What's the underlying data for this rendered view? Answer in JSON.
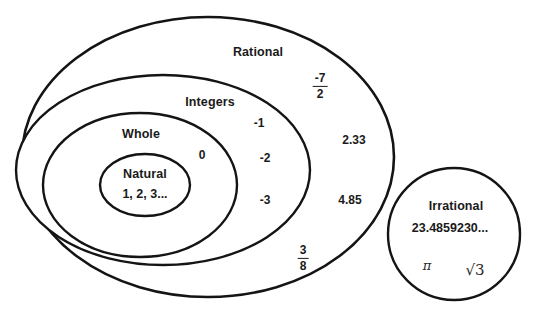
{
  "diagram": {
    "background_color": "#ffffff",
    "stroke_color": "#141414",
    "sets": [
      {
        "id": "rational",
        "label": "Rational",
        "shape": "ellipse",
        "cx": 208,
        "cy": 157,
        "rx": 186,
        "ry": 140,
        "stroke_width": 2.6,
        "label_x": 258,
        "label_y": 52
      },
      {
        "id": "integers",
        "label": "Integers",
        "shape": "ellipse",
        "cx": 163,
        "cy": 170,
        "rx": 147,
        "ry": 95,
        "stroke_width": 2.4,
        "label_x": 210,
        "label_y": 102
      },
      {
        "id": "whole",
        "label": "Whole",
        "shape": "ellipse",
        "cx": 140,
        "cy": 185,
        "rx": 97,
        "ry": 72,
        "stroke_width": 2.4,
        "label_x": 141,
        "label_y": 134
      },
      {
        "id": "natural",
        "label": "Natural",
        "shape": "ellipse",
        "cx": 145,
        "cy": 185,
        "rx": 45,
        "ry": 31,
        "stroke_width": 2.4,
        "label_x": 145,
        "label_y": 174
      },
      {
        "id": "irrational",
        "label": "Irrational",
        "shape": "circle",
        "cx": 454,
        "cy": 234,
        "r": 66,
        "stroke_width": 2.4,
        "label_x": 456,
        "label_y": 206
      }
    ],
    "elements": [
      {
        "id": "natural-examples",
        "text": "1, 2, 3...",
        "x": 145,
        "y": 194,
        "style": "elem-lg"
      },
      {
        "id": "zero",
        "text": "0",
        "x": 202,
        "y": 155,
        "style": "elem"
      },
      {
        "id": "neg-one",
        "text": "-1",
        "x": 259,
        "y": 123,
        "style": "elem"
      },
      {
        "id": "neg-two",
        "text": "-2",
        "x": 265,
        "y": 158,
        "style": "elem"
      },
      {
        "id": "neg-three",
        "text": "-3",
        "x": 265,
        "y": 200,
        "style": "elem"
      },
      {
        "id": "two-point-three-three",
        "text": "2.33",
        "x": 354,
        "y": 140,
        "style": "elem"
      },
      {
        "id": "four-point-eight-five",
        "text": "4.85",
        "x": 350,
        "y": 200,
        "style": "elem"
      },
      {
        "id": "irrational-decimal",
        "text": "23.4859230...",
        "x": 450,
        "y": 228,
        "style": "elem-lg"
      }
    ],
    "fractions": [
      {
        "id": "negative-seven-halves",
        "numerator": "-7",
        "denominator": "2",
        "x": 320,
        "y": 86
      },
      {
        "id": "three-eighths",
        "numerator": "3",
        "denominator": "8",
        "x": 303,
        "y": 258
      }
    ],
    "math_symbols": [
      {
        "id": "pi-symbol",
        "text": "π",
        "x": 427,
        "y": 265,
        "kind": "pi"
      },
      {
        "id": "sqrt-three",
        "text": "√3",
        "x": 475,
        "y": 270,
        "kind": "radical"
      }
    ]
  }
}
